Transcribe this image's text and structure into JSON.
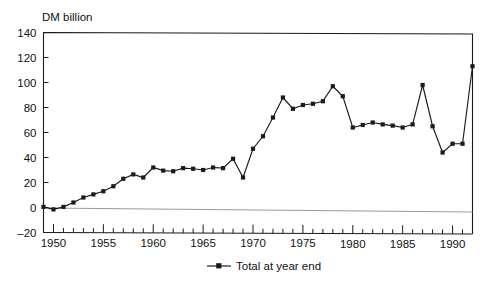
{
  "chart_data": {
    "type": "line",
    "title": "",
    "ylabel": "DM billion",
    "xlabel": "",
    "ylim": [
      -20,
      140
    ],
    "xlim": [
      1949,
      1992
    ],
    "yticks": [
      -20,
      0,
      20,
      40,
      60,
      80,
      100,
      120,
      140
    ],
    "ytick_labels": [
      "–20",
      "0",
      "20",
      "40",
      "60",
      "80",
      "100",
      "120",
      "140"
    ],
    "xticks_major": [
      1950,
      1955,
      1960,
      1965,
      1970,
      1975,
      1980,
      1985,
      1990
    ],
    "xtick_labels": [
      "1950",
      "1955",
      "1960",
      "1965",
      "1970",
      "1975",
      "1980",
      "1985",
      "1990"
    ],
    "xtick_minor_step": 1,
    "grid": false,
    "zero_line": true,
    "legend_position": "below",
    "legend": [
      "Total at year end"
    ],
    "series": [
      {
        "name": "Total at year end",
        "marker": "square",
        "x": [
          1949,
          1950,
          1951,
          1952,
          1953,
          1954,
          1955,
          1956,
          1957,
          1958,
          1959,
          1960,
          1961,
          1962,
          1963,
          1964,
          1965,
          1966,
          1967,
          1968,
          1969,
          1970,
          1971,
          1972,
          1973,
          1974,
          1975,
          1976,
          1977,
          1978,
          1979,
          1980,
          1981,
          1982,
          1983,
          1984,
          1985,
          1986,
          1987,
          1988,
          1989,
          1990,
          1991,
          1992
        ],
        "values": [
          0.5,
          -1.5,
          0.5,
          4,
          8,
          10.5,
          13,
          17,
          23,
          26.5,
          24,
          32,
          29.5,
          29,
          31.5,
          31,
          30,
          32,
          31.5,
          39,
          24,
          47,
          57,
          72,
          88,
          79,
          82,
          83,
          85,
          97,
          89,
          64,
          66,
          68,
          66.5,
          65.5,
          64,
          66.5,
          98,
          65,
          44,
          51,
          51,
          113
        ]
      }
    ]
  },
  "axis_title": {
    "text": "DM billion"
  },
  "legend": {
    "label": "Total at year end"
  }
}
